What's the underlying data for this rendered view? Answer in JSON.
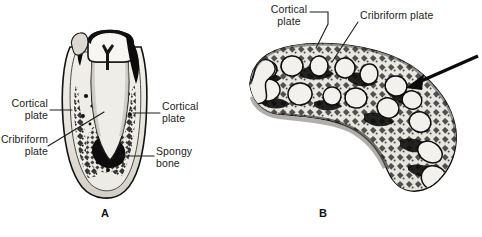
{
  "figure": {
    "background_color": "#ffffff",
    "ink_color": "#1c1c1c",
    "width": 482,
    "height": 237
  },
  "panel_a": {
    "letter": "A",
    "subject": "longitudinal-section-of-tooth-in-alveolus",
    "labels": [
      {
        "id": "cortical-plate-left",
        "text": "Cortical\nplate"
      },
      {
        "id": "cribriform-plate-left",
        "text": "Cribriform\nplate"
      },
      {
        "id": "cortical-plate-right",
        "text": "Cortical\nplate"
      },
      {
        "id": "spongy-bone-right",
        "text": "Spongy\nbone"
      }
    ]
  },
  "panel_b": {
    "letter": "B",
    "subject": "cross-section-of-alveolar-process",
    "labels": [
      {
        "id": "cortical-plate-top",
        "text": "Cortical\nplate"
      },
      {
        "id": "cribriform-plate-top",
        "text": "Cribriform plate"
      }
    ],
    "pointer": {
      "id": "cribriform-plate-arrow",
      "kind": "solid-arrow"
    }
  }
}
